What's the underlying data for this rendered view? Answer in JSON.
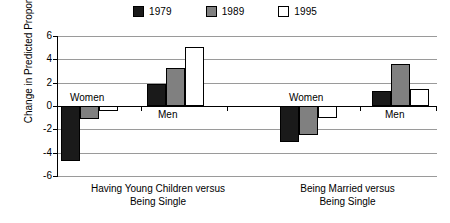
{
  "chart_data": {
    "type": "bar",
    "title": "",
    "xlabel": "",
    "ylabel": "Change in Predicted Proportion",
    "ylim": [
      -6,
      6
    ],
    "yticks": [
      6,
      4,
      2,
      0,
      -2,
      -4,
      -6
    ],
    "ytick_labels": [
      "6",
      "4",
      "2",
      "0",
      "-2",
      "-4",
      "-6"
    ],
    "grid": true,
    "legend_position": "top-center",
    "legend": [
      "1979",
      "1989",
      "1995"
    ],
    "series": [
      {
        "name": "1979",
        "color": "#1a1a1a",
        "values": [
          -4.7,
          1.9,
          -3.1,
          1.3
        ]
      },
      {
        "name": "1989",
        "color": "#808080",
        "values": [
          -1.15,
          3.25,
          -2.45,
          3.6
        ]
      },
      {
        "name": "1995",
        "color": "#ffffff",
        "values": [
          -0.4,
          5.1,
          -1.0,
          1.45
        ]
      }
    ],
    "categories": [
      "Women",
      "Men",
      "Women",
      "Men"
    ],
    "groups": [
      {
        "label_line1": "Having Young Children versus",
        "label_line2": "Being Single",
        "subgroups": [
          "Women",
          "Men"
        ]
      },
      {
        "label_line1": "Being Married versus",
        "label_line2": "Being Single",
        "subgroups": [
          "Women",
          "Men"
        ]
      }
    ],
    "annotations": [
      {
        "text": "Women",
        "group": 0,
        "subgroup": 0
      },
      {
        "text": "Men",
        "group": 0,
        "subgroup": 1
      },
      {
        "text": "Women",
        "group": 1,
        "subgroup": 0
      },
      {
        "text": "Men",
        "group": 1,
        "subgroup": 1
      }
    ]
  },
  "legend": {
    "items": [
      {
        "label": "1979",
        "color": "#1a1a1a"
      },
      {
        "label": "1989",
        "color": "#808080"
      },
      {
        "label": "1995",
        "color": "#ffffff"
      }
    ]
  },
  "axes": {
    "ylabel": "Change in Predicted Proportion",
    "yticks": [
      "6",
      "4",
      "2",
      "0",
      "-2",
      "-4",
      "-6"
    ]
  },
  "xaxis": {
    "groups": [
      {
        "line1": "Having Young Children versus",
        "line2": "Being Single"
      },
      {
        "line1": "Being Married versus",
        "line2": "Being Single"
      }
    ]
  },
  "notes": {
    "g0_women": "Women",
    "g0_men": "Men",
    "g1_women": "Women",
    "g1_men": "Men"
  }
}
